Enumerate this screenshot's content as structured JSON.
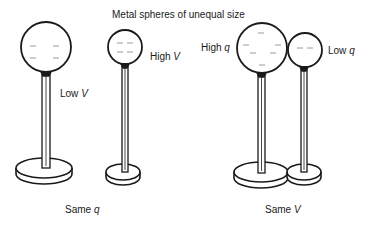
{
  "title": "Metal spheres of unequal size",
  "groups": [
    {
      "caption": {
        "text": "Same ",
        "var": "q"
      },
      "spheres": [
        {
          "label": {
            "text": "Low ",
            "var": "V"
          },
          "size": "large"
        },
        {
          "label": {
            "text": "High ",
            "var": "V"
          },
          "size": "small"
        }
      ]
    },
    {
      "caption": {
        "text": "Same ",
        "var": "V"
      },
      "spheres": [
        {
          "label": {
            "text": "High ",
            "var": "q"
          },
          "size": "large"
        },
        {
          "label": {
            "text": "Low ",
            "var": "q"
          },
          "size": "small"
        }
      ]
    }
  ],
  "colors": {
    "ink": "#1a1a1a",
    "charge_marks": "#9a9a9a",
    "background": "#ffffff"
  }
}
